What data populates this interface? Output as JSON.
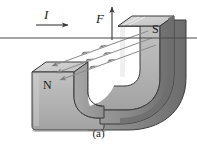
{
  "figure": {
    "caption": "(a)",
    "type": "physics-diagram",
    "background_color": "#ffffff",
    "labels": {
      "current": "I",
      "force": "F",
      "north_pole": "N",
      "south_pole": "S"
    },
    "colors": {
      "magnet_front_face": "#b3b3b3",
      "magnet_top_face": "#cfcfcf",
      "magnet_side_dark": "#8c8c8c",
      "magnet_edge_darkest": "#6e6e6e",
      "outline": "#3b3b3b",
      "wire": "#4a4a4a",
      "field_line": "#8a8a8a",
      "label_text": "#1a1a1a",
      "inner_gap": "#ffffff"
    },
    "elements": {
      "wire": {
        "name": "current-carrying-wire",
        "orientation": "horizontal",
        "y": 38,
        "x_start": 0,
        "x_end": 197
      },
      "current_arrow": {
        "name": "current-direction-arrow",
        "direction": "right",
        "x_start": 36,
        "x_end": 70,
        "y": 25
      },
      "force_arrow": {
        "name": "force-direction-arrow",
        "direction": "up",
        "x": 112,
        "y_start": 40,
        "y_end": 5
      },
      "field_lines": {
        "name": "magnetic-field-lines",
        "count": 3,
        "direction": "from S pole toward N pole (left-down)",
        "arrowheads": 3
      }
    }
  }
}
